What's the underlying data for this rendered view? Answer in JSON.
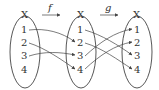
{
  "diagram": {
    "sets": [
      {
        "name": "X",
        "elements": [
          "1",
          "2",
          "3",
          "4"
        ]
      },
      {
        "name": "X",
        "elements": [
          "1",
          "2",
          "3",
          "4"
        ]
      },
      {
        "name": "X",
        "elements": [
          "1",
          "2",
          "3",
          "4"
        ]
      }
    ],
    "functions": [
      {
        "name": "f",
        "from": 0,
        "to": 1,
        "mapping": [
          [
            "1",
            "2"
          ],
          [
            "2",
            "4"
          ],
          [
            "3",
            "3"
          ]
        ]
      },
      {
        "name": "g",
        "from": 1,
        "to": 2,
        "mapping": [
          [
            "1",
            "3"
          ],
          [
            "2",
            "4"
          ],
          [
            "3",
            "1"
          ],
          [
            "4",
            "2"
          ]
        ]
      }
    ],
    "colors": {
      "stroke": "#444444",
      "text": "#333333"
    }
  }
}
